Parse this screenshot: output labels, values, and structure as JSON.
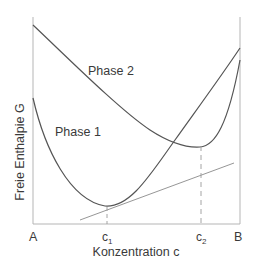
{
  "diagram": {
    "title": "",
    "y_axis_label": "Freie Enthalpie G",
    "x_axis_label": "Konzentration c",
    "x_ticks": {
      "left": "A",
      "c1_base": "c",
      "c1_sub": "1",
      "c2_base": "c",
      "c2_sub": "2",
      "right": "B"
    },
    "curves": [
      {
        "name": "Phase 1",
        "label": "Phase 1"
      },
      {
        "name": "Phase 2",
        "label": "Phase 2"
      }
    ],
    "annotations": {
      "common_tangent": "Gemeinsame Tangente",
      "dashed_lines": [
        "c1",
        "c2"
      ]
    },
    "colors": {
      "curve": "#555555",
      "axis": "#b0b0b0",
      "tangent": "#8a8a8a",
      "dash": "#9a9a9a",
      "text": "#3a3a3a"
    }
  }
}
